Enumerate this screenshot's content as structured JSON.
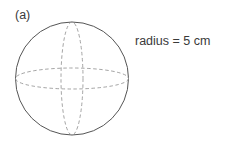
{
  "figure": {
    "part_label": "(a)",
    "annotation": "radius = 5 cm",
    "shape": "sphere",
    "colors": {
      "outline": "#555555",
      "dashed": "#9a9a9a",
      "text": "#3a3a3a"
    }
  }
}
